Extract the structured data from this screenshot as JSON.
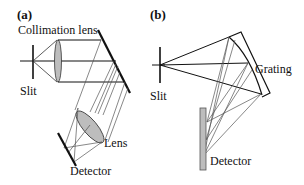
{
  "figure": {
    "panels": [
      {
        "id": "a",
        "label": "(a)",
        "components": {
          "collimation_lens": "Collimation lens",
          "slit": "Slit",
          "lens": "Lens",
          "detector": "Detector"
        }
      },
      {
        "id": "b",
        "label": "(b)",
        "components": {
          "grating": "Grating",
          "slit": "Slit",
          "detector": "Detector"
        }
      }
    ],
    "colors": {
      "line": "#111111",
      "ray": "#555555",
      "optic_fill": "#bdbdbd"
    }
  }
}
